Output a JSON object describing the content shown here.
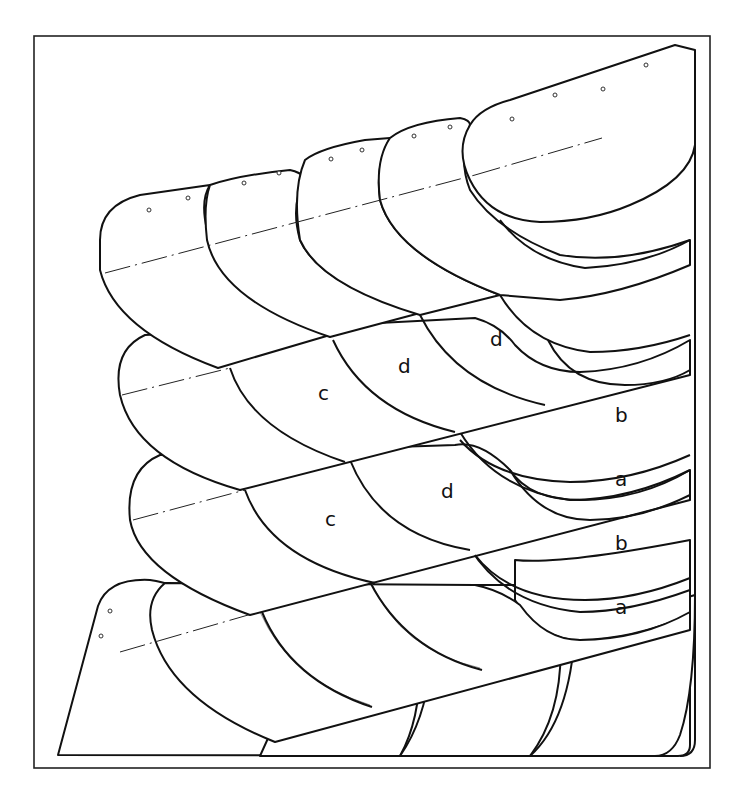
{
  "figure": {
    "type": "technical line drawing",
    "stroke_color": "#111111",
    "background": "#ffffff"
  },
  "labels": [
    {
      "id": "label-d-1",
      "text": "d",
      "x": 490,
      "y": 346
    },
    {
      "id": "label-d-2",
      "text": "d",
      "x": 398,
      "y": 373
    },
    {
      "id": "label-c-1",
      "text": "c",
      "x": 318,
      "y": 400
    },
    {
      "id": "label-b-1",
      "text": "b",
      "x": 615,
      "y": 422
    },
    {
      "id": "label-a-1",
      "text": "a",
      "x": 615,
      "y": 486
    },
    {
      "id": "label-d-3",
      "text": "d",
      "x": 441,
      "y": 498
    },
    {
      "id": "label-c-2",
      "text": "c",
      "x": 325,
      "y": 526
    },
    {
      "id": "label-b-2",
      "text": "b",
      "x": 615,
      "y": 550
    },
    {
      "id": "label-a-2",
      "text": "a",
      "x": 615,
      "y": 614
    }
  ]
}
